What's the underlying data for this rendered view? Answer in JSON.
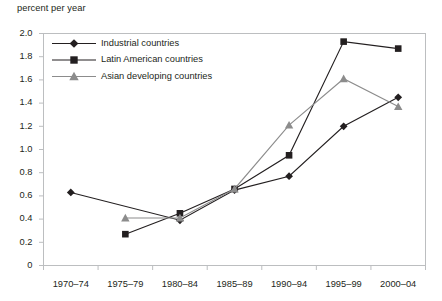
{
  "figure": {
    "axis_title": "percent per year",
    "background": "#ffffff",
    "border_color": "#bcbec0",
    "grid": false
  },
  "chart_data": {
    "type": "line",
    "title": "",
    "subtitle": "",
    "xlabel": "",
    "ylabel": "percent per year",
    "ylim": [
      0,
      2.0
    ],
    "ytick_labels": [
      "0",
      "0.2",
      "0.4",
      "0.6",
      "0.8",
      "1.0",
      "1.2",
      "1.4",
      "1.6",
      "1.8",
      "2.0"
    ],
    "ytick_values": [
      0,
      0.2,
      0.4,
      0.6,
      0.8,
      1.0,
      1.2,
      1.4,
      1.6,
      1.8,
      2.0
    ],
    "categories": [
      "1970–74",
      "1975–79",
      "1980–84",
      "1985–89",
      "1990–94",
      "1995–99",
      "2000–04"
    ],
    "legend_position": "top-left",
    "series": [
      {
        "name": "Industrial countries",
        "marker": "diamond",
        "color": "#231f20",
        "values": [
          0.63,
          null,
          0.39,
          0.65,
          0.77,
          1.2,
          1.45
        ]
      },
      {
        "name": "Latin American countries",
        "marker": "square",
        "color": "#231f20",
        "values": [
          null,
          0.27,
          0.45,
          0.66,
          0.95,
          1.93,
          1.87
        ]
      },
      {
        "name": "Asian developing countries",
        "marker": "triangle",
        "color": "#8c8c8c",
        "values": [
          null,
          0.41,
          0.41,
          0.66,
          1.21,
          1.61,
          1.37
        ]
      }
    ]
  }
}
